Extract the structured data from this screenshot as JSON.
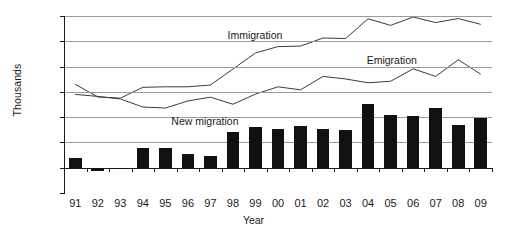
{
  "chart_data": {
    "type": "bar",
    "title": "",
    "xlabel": "Year",
    "ylabel": "Thousands",
    "categories": [
      "91",
      "92",
      "93",
      "94",
      "95",
      "96",
      "97",
      "98",
      "99",
      "00",
      "01",
      "02",
      "03",
      "04",
      "05",
      "06",
      "07",
      "08",
      "09"
    ],
    "ylim": [
      -100,
      600
    ],
    "yticks": [
      -100,
      0,
      100,
      200,
      300,
      400,
      500,
      600
    ],
    "ytick_labels": [
      "-100",
      "0",
      "100",
      "200",
      "300",
      "400",
      "500",
      "600"
    ],
    "grid": true,
    "legend_position": "inline-annotations",
    "series": [
      {
        "name": "New migration",
        "type": "bar",
        "color": "#111111",
        "values": [
          40,
          -15,
          -5,
          77,
          77,
          55,
          48,
          140,
          160,
          155,
          163,
          152,
          148,
          253,
          208,
          205,
          237,
          170,
          198
        ]
      },
      {
        "name": "Immigration",
        "type": "line",
        "color": "#3a3a3a",
        "values": [
          330,
          280,
          275,
          318,
          320,
          320,
          327,
          390,
          454,
          479,
          481,
          513,
          511,
          589,
          563,
          596,
          574,
          590,
          567
        ]
      },
      {
        "name": "Emigration",
        "type": "line",
        "color": "#3a3a3a",
        "values": [
          290,
          282,
          272,
          240,
          236,
          264,
          279,
          251,
          291,
          320,
          308,
          361,
          351,
          336,
          342,
          391,
          361,
          427,
          370
        ]
      }
    ],
    "annotations": [
      {
        "text": "Immigration",
        "series": "Immigration"
      },
      {
        "text": "Emigration",
        "series": "Emigration"
      },
      {
        "text": "New migration",
        "series": "New migration"
      }
    ]
  }
}
